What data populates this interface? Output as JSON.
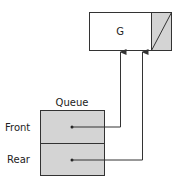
{
  "node": {
    "value": "G",
    "next": "null"
  },
  "queue": {
    "title": "Queue",
    "fields": [
      {
        "label": "Front"
      },
      {
        "label": "Rear"
      }
    ]
  },
  "colors": {
    "fill_gray": "#d4d4d4",
    "stroke": "#333333"
  }
}
